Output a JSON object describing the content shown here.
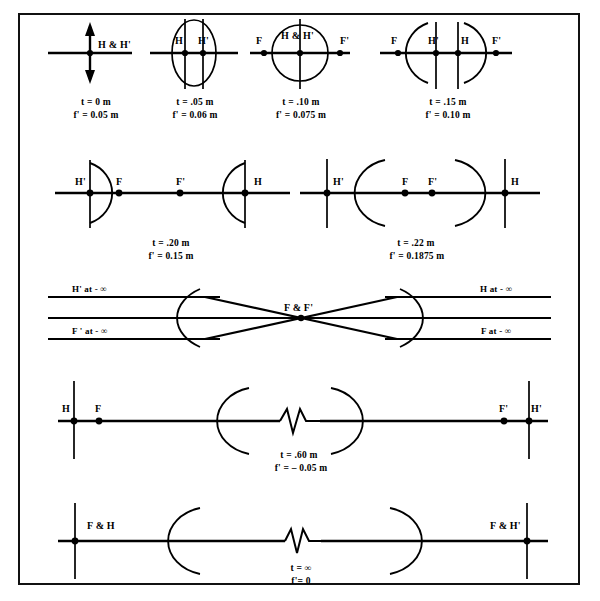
{
  "figure": {
    "border_color": "#111111",
    "line_color": "#000000",
    "background": "#ffffff"
  },
  "rows": [
    {
      "id": "row-1",
      "cells": [
        {
          "id": "case-1",
          "element_labels": [
            "H & H'"
          ],
          "caption": {
            "t": "t = 0 m",
            "f": "f' = 0.05 m"
          },
          "shape": "double-arrow"
        },
        {
          "id": "case-2",
          "element_labels": [
            "H",
            "H'"
          ],
          "caption": {
            "t": "t = .05 m",
            "f": "f' = 0.06 m"
          },
          "shape": "ellipse-lens"
        },
        {
          "id": "case-3",
          "element_labels": [
            "F",
            "H & H'",
            "F'"
          ],
          "caption": {
            "t": "t = .10 m",
            "f": "f' = 0.075 m"
          },
          "shape": "circle-lens"
        },
        {
          "id": "case-4",
          "element_labels": [
            "F",
            "H'",
            "H",
            "F'"
          ],
          "caption": {
            "t": "t = .15 m",
            "f": "f' = 0.10 m"
          },
          "shape": "biconvex-arcs"
        }
      ]
    },
    {
      "id": "row-2",
      "cells": [
        {
          "id": "case-5",
          "element_labels": [
            "H'",
            "F",
            "F'",
            "H"
          ],
          "caption": {
            "t": "t = .20 m",
            "f": "f' = 0.15 m"
          },
          "shape": "wide-biconvex-arcs"
        },
        {
          "id": "case-6",
          "element_labels": [
            "H'",
            "F",
            "F'",
            "H"
          ],
          "caption": {
            "t": "t = .22 m",
            "f": "f' = 0.1875 m"
          },
          "shape": "concave-facing-arcs"
        }
      ]
    },
    {
      "id": "row-3",
      "cells": [
        {
          "id": "case-7",
          "element_labels": [
            "H' at - ∞",
            "F' at - ∞",
            "F & F'",
            "H at - ∞",
            "F at - ∞"
          ],
          "caption": {
            "t": "",
            "f": ""
          },
          "shape": "afocal-crossed-rays"
        }
      ]
    },
    {
      "id": "row-4",
      "cells": [
        {
          "id": "case-8",
          "element_labels": [
            "H",
            "F",
            "F'",
            "H'"
          ],
          "caption": {
            "t": "t = .60 m",
            "f": "f' = –  0.05 m"
          },
          "shape": "separated-arcs-break"
        }
      ]
    },
    {
      "id": "row-5",
      "cells": [
        {
          "id": "case-9",
          "element_labels": [
            "F & H",
            "F & H'"
          ],
          "caption": {
            "t": "t = ∞",
            "f": "f'= 0"
          },
          "shape": "separated-arcs-break"
        }
      ]
    }
  ],
  "labels": {
    "r1c1_HH": "H & H'",
    "r1c1_t": "t = 0 m",
    "r1c1_f": "f' = 0.05 m",
    "r1c2_H": "H",
    "r1c2_Hp": "H'",
    "r1c2_t": "t = .05 m",
    "r1c2_f": "f' = 0.06 m",
    "r1c3_F": "F",
    "r1c3_HH": "H & H'",
    "r1c3_Fp": "F'",
    "r1c3_t": "t = .10 m",
    "r1c3_f": "f' = 0.075 m",
    "r1c4_F": "F",
    "r1c4_Hp": "H'",
    "r1c4_H": "H",
    "r1c4_Fp": "F'",
    "r1c4_t": "t = .15 m",
    "r1c4_f": "f' = 0.10 m",
    "r2c1_Hp": "H'",
    "r2c1_F": "F",
    "r2c1_Fp": "F'",
    "r2c1_H": "H",
    "r2c1_t": "t = .20 m",
    "r2c1_f": "f' = 0.15 m",
    "r2c2_Hp": "H'",
    "r2c2_F": "F",
    "r2c2_Fp": "F'",
    "r2c2_H": "H",
    "r2c2_t": "t = .22 m",
    "r2c2_f": "f' = 0.1875 m",
    "r3_Hp_inf": "H' at - ∞",
    "r3_Fp_inf": "F ' at - ∞",
    "r3_FFp": "F & F'",
    "r3_H_inf": "H at - ∞",
    "r3_F_inf": "F at - ∞",
    "r4_H": "H",
    "r4_F": "F",
    "r4_Fp": "F'",
    "r4_Hp": "H'",
    "r4_t": "t = .60 m",
    "r4_f": "f' = –  0.05 m",
    "r5_FH": "F & H",
    "r5_FHp": "F & H'",
    "r5_t": "t = ∞",
    "r5_f": "f'= 0"
  }
}
